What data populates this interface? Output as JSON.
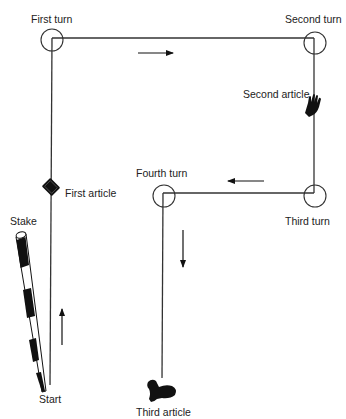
{
  "diagram": {
    "type": "search-pattern",
    "colors": {
      "line": "#333333",
      "fill": "#111111",
      "background": "#ffffff",
      "text": "#222222"
    },
    "labels": {
      "first_turn": "First turn",
      "second_turn": "Second turn",
      "third_turn": "Third turn",
      "fourth_turn": "Fourth turn",
      "first_article": "First article",
      "second_article": "Second article",
      "third_article": "Third article",
      "stake": "Stake",
      "start": "Start"
    },
    "nodes": [
      {
        "id": "start",
        "label": "Start",
        "x": 50,
        "y": 385
      },
      {
        "id": "first_turn",
        "label": "First turn",
        "x": 52,
        "y": 38
      },
      {
        "id": "second_turn",
        "label": "Second turn",
        "x": 314,
        "y": 38
      },
      {
        "id": "third_turn",
        "label": "Third turn",
        "x": 314,
        "y": 193
      },
      {
        "id": "fourth_turn",
        "label": "Fourth turn",
        "x": 163,
        "y": 193
      },
      {
        "id": "third_article",
        "label": "Third article",
        "x": 163,
        "y": 385
      }
    ],
    "articles": [
      {
        "label": "First article",
        "icon": "wallet-icon",
        "on_leg": "start-first_turn"
      },
      {
        "label": "Second article",
        "icon": "glove-icon",
        "on_leg": "second_turn-third_turn"
      },
      {
        "label": "Third article",
        "icon": "boot-icon",
        "on_leg": "end"
      }
    ],
    "direction_arrows": [
      "up",
      "right",
      "left",
      "down"
    ]
  }
}
